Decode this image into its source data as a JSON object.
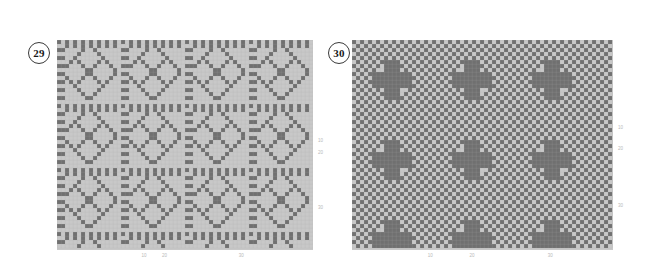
{
  "page": {
    "background": "#ffffff",
    "width": 648,
    "height": 265
  },
  "palette": {
    "dark_cell": "#707070",
    "light_cell": "#c8c8c8",
    "grid_line": "#b0b0b0",
    "tick_text": "#b9b9b9",
    "badge_border": "#3a3a3a",
    "badge_text": "#1a1a1a"
  },
  "figures": [
    {
      "id": "figure-29",
      "badge_label": "29",
      "badge": {
        "x": 28,
        "y": 42
      },
      "grid": {
        "x": 57,
        "y": 40,
        "width": 256,
        "height": 210
      },
      "ticks_bottom": [
        {
          "label": "10",
          "pos": 0.34
        },
        {
          "label": "20",
          "pos": 0.42
        },
        {
          "label": "30",
          "pos": 0.72
        }
      ],
      "ticks_right": [
        {
          "label": "10",
          "pos": 0.48
        },
        {
          "label": "20",
          "pos": 0.54
        },
        {
          "label": "30",
          "pos": 0.8
        }
      ],
      "chart_data": {
        "type": "heatmap",
        "title": "29",
        "xlabel": "",
        "ylabel": "",
        "cols": 64,
        "rows": 52,
        "cell_size_px": 4,
        "values_binary": true,
        "colors": [
          "#c8c8c8",
          "#707070"
        ],
        "pattern": "woven-draft-diamond-cross",
        "tile_period": 16,
        "description": "Binary weave draft: repeating 16x16 tiles containing a concentric diamond enclosing an X/cross motif, separated by dense twill bands."
      }
    },
    {
      "id": "figure-30",
      "badge_label": "30",
      "badge": {
        "x": 328,
        "y": 42
      },
      "grid": {
        "x": 352,
        "y": 40,
        "width": 261,
        "height": 210
      },
      "ticks_bottom": [
        {
          "label": "10",
          "pos": 0.3
        },
        {
          "label": "20",
          "pos": 0.46
        },
        {
          "label": "30",
          "pos": 0.76
        }
      ],
      "ticks_right": [
        {
          "label": "10",
          "pos": 0.42
        },
        {
          "label": "20",
          "pos": 0.52
        },
        {
          "label": "30",
          "pos": 0.79
        }
      ],
      "chart_data": {
        "type": "heatmap",
        "title": "30",
        "xlabel": "",
        "ylabel": "",
        "cols": 65,
        "rows": 52,
        "cell_size_px": 4,
        "values_binary": true,
        "colors": [
          "#c8c8c8",
          "#707070"
        ],
        "pattern": "woven-draft-checker-plus",
        "tile_period": 20,
        "description": "Binary weave draft: fine checkerboard ground overlaid with symmetric plus/cross and diamond medallions repeating on a 20x20 lattice."
      }
    }
  ]
}
